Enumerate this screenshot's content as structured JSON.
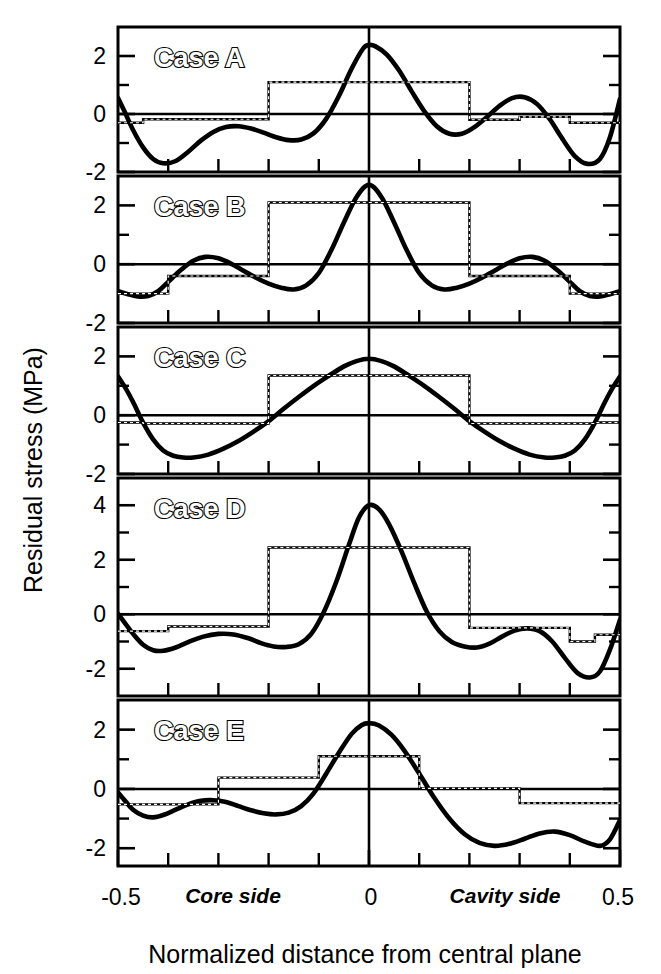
{
  "figure": {
    "ylabel": "Residual stress  (MPa)",
    "xlabel": "Normalized distance from central plane",
    "x_tick_labels": [
      "-0.5",
      "0",
      "0.5"
    ],
    "x_annotations": [
      "Core side",
      "Cavity side"
    ],
    "xlim": [
      -0.5,
      0.5
    ],
    "colors": {
      "ink": "#000000",
      "paper": "#ffffff"
    }
  },
  "chart_data": {
    "type": "line",
    "title": "",
    "xlabel": "Normalized distance from central plane",
    "ylabel": "Residual stress  (MPa)",
    "xlim": [
      -0.5,
      0.5
    ],
    "grid": false,
    "legend": "none",
    "annotations": [
      "Core side",
      "Cavity side"
    ],
    "x_ticks": [
      -0.5,
      0.0,
      0.5
    ],
    "x_minor_ticks": [
      -0.4,
      -0.3,
      -0.2,
      -0.1,
      0.1,
      0.2,
      0.3,
      0.4
    ],
    "panels": [
      {
        "label": "Case A",
        "ylim": [
          -2,
          3
        ],
        "y_ticks": [
          2,
          0,
          -2
        ],
        "y_minor_ticks": [
          1,
          -1
        ],
        "series": [
          {
            "name": "measured-curve",
            "style": "smooth-solid",
            "x": [
              -0.5,
              -0.486,
              -0.47,
              -0.45,
              -0.43,
              -0.41,
              -0.385,
              -0.36,
              -0.335,
              -0.31,
              -0.285,
              -0.26,
              -0.235,
              -0.21,
              -0.185,
              -0.16,
              -0.135,
              -0.11,
              -0.085,
              -0.06,
              -0.035,
              -0.012,
              0.0,
              0.012,
              0.035,
              0.06,
              0.085,
              0.11,
              0.135,
              0.16,
              0.185,
              0.21,
              0.235,
              0.26,
              0.285,
              0.31,
              0.335,
              0.36,
              0.385,
              0.41,
              0.435,
              0.46,
              0.48,
              0.5
            ],
            "y": [
              0.55,
              0.05,
              -0.55,
              -1.15,
              -1.55,
              -1.7,
              -1.62,
              -1.3,
              -0.92,
              -0.62,
              -0.45,
              -0.42,
              -0.5,
              -0.64,
              -0.8,
              -0.9,
              -0.88,
              -0.66,
              -0.16,
              0.62,
              1.55,
              2.25,
              2.38,
              2.34,
              2.06,
              1.5,
              0.78,
              0.1,
              -0.42,
              -0.68,
              -0.68,
              -0.45,
              -0.1,
              0.28,
              0.55,
              0.58,
              0.34,
              -0.18,
              -0.85,
              -1.45,
              -1.72,
              -1.55,
              -0.8,
              0.52
            ]
          },
          {
            "name": "layer-average-steps",
            "style": "step-hatched",
            "edges": [
              -0.5,
              -0.45,
              -0.2,
              0.2,
              0.3,
              0.4,
              0.5
            ],
            "values": [
              -0.3,
              -0.18,
              1.1,
              -0.2,
              -0.1,
              -0.3
            ]
          }
        ]
      },
      {
        "label": "Case B",
        "ylim": [
          -2,
          3
        ],
        "y_ticks": [
          2,
          0,
          -2
        ],
        "y_minor_ticks": [
          1,
          -1
        ],
        "series": [
          {
            "name": "measured-curve",
            "style": "smooth-solid",
            "x": [
              -0.5,
              -0.48,
              -0.46,
              -0.44,
              -0.42,
              -0.4,
              -0.375,
              -0.35,
              -0.325,
              -0.3,
              -0.275,
              -0.25,
              -0.225,
              -0.2,
              -0.175,
              -0.15,
              -0.125,
              -0.1,
              -0.075,
              -0.05,
              -0.025,
              0.0,
              0.025,
              0.05,
              0.075,
              0.1,
              0.125,
              0.15,
              0.175,
              0.2,
              0.225,
              0.25,
              0.275,
              0.3,
              0.325,
              0.35,
              0.375,
              0.4,
              0.42,
              0.44,
              0.46,
              0.48,
              0.5
            ],
            "y": [
              -0.92,
              -1.02,
              -1.1,
              -1.08,
              -0.92,
              -0.6,
              -0.2,
              0.12,
              0.25,
              0.2,
              0.02,
              -0.22,
              -0.46,
              -0.66,
              -0.8,
              -0.86,
              -0.72,
              -0.3,
              0.48,
              1.42,
              2.28,
              2.7,
              2.28,
              1.42,
              0.48,
              -0.3,
              -0.72,
              -0.86,
              -0.8,
              -0.66,
              -0.46,
              -0.22,
              0.02,
              0.2,
              0.25,
              0.12,
              -0.2,
              -0.6,
              -0.92,
              -1.08,
              -1.1,
              -1.02,
              -0.92
            ]
          },
          {
            "name": "layer-average-steps",
            "style": "step-hatched",
            "edges": [
              -0.5,
              -0.4,
              -0.2,
              0.2,
              0.4,
              0.5
            ],
            "values": [
              -1.0,
              -0.4,
              2.1,
              -0.4,
              -1.0
            ]
          }
        ]
      },
      {
        "label": "Case C",
        "ylim": [
          -2,
          3
        ],
        "y_ticks": [
          2,
          0,
          -2
        ],
        "y_minor_ticks": [
          1,
          -1
        ],
        "series": [
          {
            "name": "measured-curve",
            "style": "smooth-solid",
            "x": [
              -0.5,
              -0.485,
              -0.47,
              -0.45,
              -0.43,
              -0.41,
              -0.39,
              -0.37,
              -0.35,
              -0.32,
              -0.29,
              -0.26,
              -0.23,
              -0.2,
              -0.17,
              -0.14,
              -0.11,
              -0.08,
              -0.05,
              -0.025,
              0.0,
              0.025,
              0.05,
              0.08,
              0.11,
              0.14,
              0.17,
              0.2,
              0.23,
              0.26,
              0.29,
              0.32,
              0.35,
              0.37,
              0.39,
              0.41,
              0.43,
              0.45,
              0.47,
              0.485,
              0.5
            ],
            "y": [
              1.32,
              0.92,
              0.45,
              -0.25,
              -0.82,
              -1.2,
              -1.38,
              -1.44,
              -1.44,
              -1.34,
              -1.14,
              -0.88,
              -0.56,
              -0.2,
              0.22,
              0.62,
              1.0,
              1.34,
              1.66,
              1.84,
              1.92,
              1.84,
              1.66,
              1.34,
              1.0,
              0.62,
              0.22,
              -0.2,
              -0.56,
              -0.88,
              -1.14,
              -1.34,
              -1.44,
              -1.44,
              -1.38,
              -1.2,
              -0.82,
              -0.25,
              0.45,
              0.92,
              1.32
            ]
          },
          {
            "name": "layer-average-steps",
            "style": "step-hatched",
            "edges": [
              -0.5,
              -0.45,
              -0.2,
              0.2,
              0.45,
              0.5
            ],
            "values": [
              -0.25,
              -0.28,
              1.35,
              -0.28,
              -0.25
            ]
          }
        ]
      },
      {
        "label": "Case D",
        "ylim": [
          -3,
          5
        ],
        "y_ticks": [
          4,
          2,
          0,
          -2
        ],
        "y_minor_ticks": [
          3,
          1,
          -1
        ],
        "series": [
          {
            "name": "measured-curve",
            "style": "smooth-solid",
            "x": [
              -0.5,
              -0.485,
              -0.47,
              -0.45,
              -0.43,
              -0.41,
              -0.385,
              -0.36,
              -0.33,
              -0.3,
              -0.27,
              -0.24,
              -0.215,
              -0.19,
              -0.165,
              -0.14,
              -0.115,
              -0.09,
              -0.065,
              -0.04,
              -0.02,
              0.0,
              0.02,
              0.04,
              0.065,
              0.09,
              0.115,
              0.14,
              0.165,
              0.19,
              0.215,
              0.24,
              0.265,
              0.29,
              0.315,
              0.34,
              0.365,
              0.39,
              0.415,
              0.44,
              0.46,
              0.48,
              0.5
            ],
            "y": [
              0.02,
              -0.35,
              -0.72,
              -1.12,
              -1.32,
              -1.34,
              -1.22,
              -1.02,
              -0.82,
              -0.72,
              -0.74,
              -0.88,
              -1.06,
              -1.18,
              -1.2,
              -1.1,
              -0.72,
              0.08,
              1.2,
              2.55,
              3.55,
              4.0,
              3.85,
              3.3,
              2.3,
              1.15,
              0.1,
              -0.62,
              -1.02,
              -1.18,
              -1.22,
              -1.08,
              -0.82,
              -0.6,
              -0.52,
              -0.62,
              -1.0,
              -1.6,
              -2.15,
              -2.32,
              -2.1,
              -1.3,
              -0.2
            ]
          },
          {
            "name": "layer-average-steps",
            "style": "step-hatched",
            "edges": [
              -0.5,
              -0.4,
              -0.2,
              0.2,
              0.4,
              0.45,
              0.5
            ],
            "values": [
              -0.62,
              -0.45,
              2.45,
              -0.5,
              -1.0,
              -0.75
            ]
          }
        ]
      },
      {
        "label": "Case E",
        "ylim": [
          -2.6,
          3
        ],
        "y_ticks": [
          2,
          0,
          -2
        ],
        "y_minor_ticks": [
          1,
          -1
        ],
        "series": [
          {
            "name": "measured-curve",
            "style": "smooth-solid",
            "x": [
              -0.5,
              -0.485,
              -0.47,
              -0.45,
              -0.43,
              -0.41,
              -0.385,
              -0.36,
              -0.335,
              -0.31,
              -0.285,
              -0.26,
              -0.235,
              -0.21,
              -0.185,
              -0.16,
              -0.135,
              -0.11,
              -0.085,
              -0.06,
              -0.035,
              -0.015,
              0.0,
              0.02,
              0.045,
              0.07,
              0.1,
              0.13,
              0.16,
              0.19,
              0.22,
              0.25,
              0.28,
              0.31,
              0.34,
              0.37,
              0.4,
              0.43,
              0.46,
              0.48,
              0.5
            ],
            "y": [
              -0.12,
              -0.42,
              -0.7,
              -0.9,
              -0.96,
              -0.88,
              -0.7,
              -0.52,
              -0.4,
              -0.38,
              -0.44,
              -0.58,
              -0.72,
              -0.82,
              -0.86,
              -0.8,
              -0.58,
              -0.14,
              0.52,
              1.22,
              1.85,
              2.15,
              2.22,
              2.14,
              1.82,
              1.3,
              0.52,
              -0.3,
              -1.0,
              -1.52,
              -1.82,
              -1.92,
              -1.85,
              -1.68,
              -1.5,
              -1.44,
              -1.56,
              -1.78,
              -1.92,
              -1.7,
              -1.05
            ]
          },
          {
            "name": "layer-average-steps",
            "style": "step-hatched",
            "edges": [
              -0.5,
              -0.3,
              -0.1,
              0.1,
              0.3,
              0.5
            ],
            "values": [
              -0.52,
              0.38,
              1.1,
              0.02,
              -0.48
            ]
          }
        ]
      }
    ]
  }
}
